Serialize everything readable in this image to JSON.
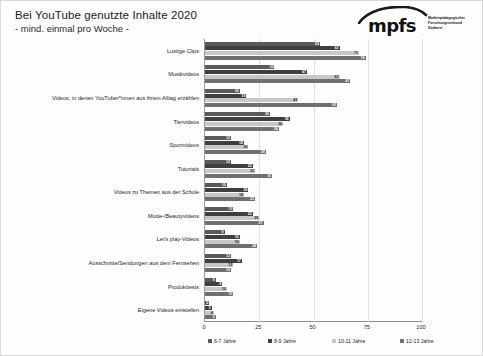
{
  "header": {
    "title": "Bei YouTube genutzte Inhalte 2020",
    "subtitle": "- mind. einmal pro Woche -"
  },
  "logo": {
    "wordmark": "mpfs",
    "subtitle": "Medienpädagogischer Forschungsverbund Südwest",
    "icon": "mpfs-arc-logo"
  },
  "chart_data": {
    "type": "bar",
    "orientation": "horizontal",
    "title": "Bei YouTube genutzte Inhalte 2020",
    "subtitle": "- mind. einmal pro Woche -",
    "xlabel": "",
    "ylabel": "",
    "xlim": [
      0,
      100
    ],
    "xticks": [
      0,
      25,
      50,
      75,
      100
    ],
    "tick_labels": [
      "0",
      "25",
      "50",
      "75",
      "100"
    ],
    "grid": true,
    "legend_position": "bottom",
    "categories": [
      "Lustige Clips",
      "Musikvideos",
      "Videos, in denen YouTuber*innen aus ihrem Alltag erzählen",
      "Tiervideos",
      "Sportvideos",
      "Tutorials",
      "Videos zu Themen aus der Schule",
      "Mode-/Beautyvideos",
      "Let's play-Videos",
      "Ausschnitte/Sendungen aus dem Fernsehen",
      "Produkttests",
      "Eigene Videos einstellen"
    ],
    "series": [
      {
        "name": "6-7 Jahre",
        "color": "#58595b",
        "values": [
          53,
          32,
          16,
          30,
          12,
          12,
          10,
          13,
          9,
          12,
          5,
          2
        ]
      },
      {
        "name": "8-9 Jahre",
        "color": "#3f3f41",
        "values": [
          62,
          47,
          19,
          39,
          18,
          22,
          20,
          22,
          16,
          17,
          8,
          3
        ]
      },
      {
        "name": "10-11 Jahre",
        "color": "#c6c7c9",
        "values": [
          71,
          62,
          43,
          36,
          20,
          23,
          18,
          25,
          16,
          13,
          10,
          4
        ]
      },
      {
        "name": "12-13 Jahre",
        "color": "#6f7072",
        "values": [
          74,
          67,
          61,
          34,
          28,
          31,
          23,
          27,
          24,
          12,
          13,
          5
        ]
      }
    ],
    "value_labels": [
      [
        "53",
        "62",
        "71",
        "74"
      ],
      [
        "32",
        "47",
        "62",
        "67"
      ],
      [
        "16",
        "19",
        "43",
        "61"
      ],
      [
        "30",
        "39",
        "36",
        "34"
      ],
      [
        "12",
        "18",
        "20",
        "28"
      ],
      [
        "12",
        "22",
        "23",
        "31"
      ],
      [
        "10",
        "20",
        "18",
        "23"
      ],
      [
        "13",
        "22",
        "25",
        "27"
      ],
      [
        "9",
        "16",
        "16",
        "24"
      ],
      [
        "12",
        "17",
        "13",
        "12"
      ],
      [
        "5",
        "8",
        "10",
        "13"
      ],
      [
        "2",
        "3",
        "4",
        "5"
      ]
    ]
  }
}
